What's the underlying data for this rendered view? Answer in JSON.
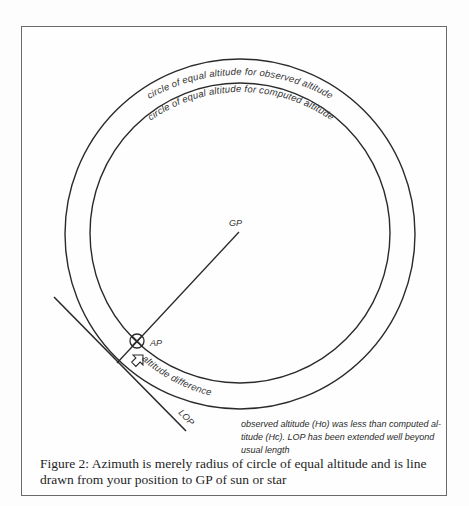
{
  "figure": {
    "labels": {
      "outer_circle": "circle of  equal  altitude for  observed  altitude",
      "inner_circle": "circle of  equal  altitude for  computed  altitude",
      "gp": "GP",
      "ap": "AP",
      "altitude_difference": "altitude  difference",
      "lop": "LOP"
    },
    "note": "observed altitude (Ho) was less than computed al-titude (Hc). LOP has been extended well beyond usual length",
    "caption": "Figure 2: Azimuth is merely radius of circle of equal altitude and is line drawn from your position to GP of sun or star"
  },
  "colors": {
    "ink": "#2a2a2a",
    "frame": "#6a6a6a",
    "background": "#fefefe"
  }
}
